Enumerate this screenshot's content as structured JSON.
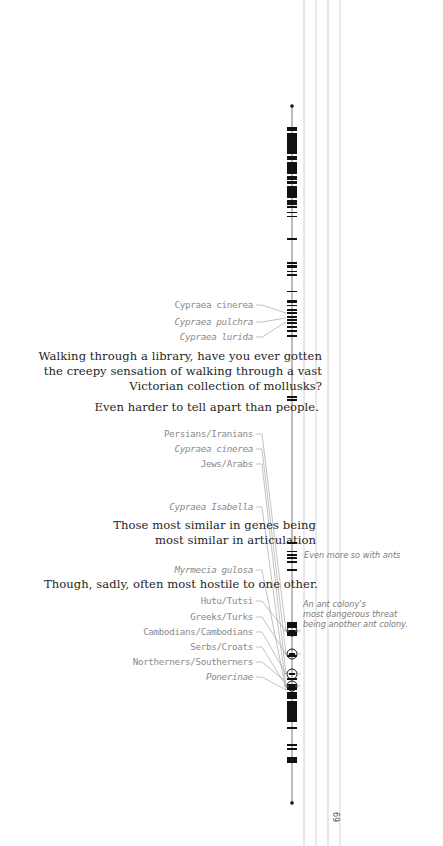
{
  "colors": {
    "ink": "#111111",
    "leader": "#9a9a9a",
    "guide": "#c8c8c8",
    "label": "#8a8a8a",
    "quote": "#1e1e1e"
  },
  "page_number": "69",
  "guides_x": [
    304,
    316,
    328,
    340
  ],
  "axis": {
    "x": 292,
    "top": 106,
    "bottom": 803
  },
  "bars": [
    [
      127,
      131
    ],
    [
      133,
      154
    ],
    [
      156,
      160
    ],
    [
      162,
      174
    ],
    [
      176,
      180
    ],
    [
      181,
      184
    ],
    [
      186,
      198
    ],
    [
      200,
      205
    ],
    [
      206,
      208
    ],
    [
      212,
      213
    ],
    [
      216,
      217
    ],
    [
      238,
      240
    ],
    [
      262,
      264
    ],
    [
      265,
      268
    ],
    [
      271,
      272
    ],
    [
      274,
      276
    ],
    [
      291,
      292
    ],
    [
      300,
      303
    ],
    [
      305,
      306
    ],
    [
      309,
      311
    ],
    [
      312,
      314
    ],
    [
      316,
      318
    ],
    [
      319,
      321
    ],
    [
      322,
      324
    ],
    [
      326,
      328
    ],
    [
      330,
      332
    ],
    [
      335,
      337
    ],
    [
      396,
      398
    ],
    [
      399,
      401
    ],
    [
      542,
      544
    ],
    [
      551,
      552
    ],
    [
      554,
      556
    ],
    [
      557,
      559
    ],
    [
      561,
      563
    ],
    [
      569,
      571
    ],
    [
      622,
      628
    ],
    [
      630,
      636
    ],
    [
      655,
      657
    ],
    [
      678,
      680
    ],
    [
      684,
      690
    ],
    [
      692,
      699
    ],
    [
      701,
      722
    ],
    [
      727,
      729
    ],
    [
      744,
      746
    ],
    [
      748,
      750
    ],
    [
      757,
      763
    ]
  ],
  "circles": [
    631,
    654,
    674,
    686
  ],
  "labels": [
    {
      "id": "cypraea-cinerea-1",
      "text": "Cypraea cinerea",
      "x": 253,
      "y": 305,
      "italic": false,
      "target": 313
    },
    {
      "id": "cypraea-pulchra",
      "text": "Cypraea pulchra",
      "x": 253,
      "y": 322,
      "italic": true,
      "target": 318
    },
    {
      "id": "cypraea-lurida",
      "text": "Cypraea lurida",
      "x": 253,
      "y": 337,
      "italic": true,
      "target": 322
    },
    {
      "id": "persians-iranians",
      "text": "Persians/Iranians",
      "x": 253,
      "y": 434,
      "italic": false,
      "target": 631
    },
    {
      "id": "cypraea-cinerea-2",
      "text": "Cypraea cinerea",
      "x": 253,
      "y": 449,
      "italic": true,
      "target": 654
    },
    {
      "id": "jews-arabs",
      "text": "Jews/Arabs",
      "x": 253,
      "y": 464,
      "italic": false,
      "target": 674
    },
    {
      "id": "cypraea-isabella",
      "text": "Cypraea Isabella",
      "x": 253,
      "y": 507,
      "italic": true,
      "target": 686
    },
    {
      "id": "myrmecia-gulosa",
      "text": "Myrmecia gulosa",
      "x": 253,
      "y": 570,
      "italic": true,
      "target": 690
    },
    {
      "id": "hutu-tutsi",
      "text": "Hutu/Tutsi",
      "x": 253,
      "y": 601,
      "italic": false,
      "target": 631
    },
    {
      "id": "greeks-turks",
      "text": "Greeks/Turks",
      "x": 253,
      "y": 617,
      "italic": false,
      "target": 654
    },
    {
      "id": "cambodians",
      "text": "Cambodians/Cambodians",
      "x": 253,
      "y": 632,
      "italic": false,
      "target": 674
    },
    {
      "id": "serbs-croats",
      "text": "Serbs/Croats",
      "x": 253,
      "y": 647,
      "italic": false,
      "target": 686
    },
    {
      "id": "northerners-southerners",
      "text": "Northerners/Southerners",
      "x": 253,
      "y": 662,
      "italic": false,
      "target": 682
    },
    {
      "id": "ponerinae",
      "text": "Ponerinae",
      "x": 253,
      "y": 677,
      "italic": true,
      "target": 690
    }
  ],
  "quotes": [
    {
      "id": "quote-library",
      "lines": [
        "Walking through a library, have you ever gotten",
        "the creepy sensation of walking through a vast",
        "Victorian collection of mollusks?"
      ],
      "right": 322,
      "top": 349
    },
    {
      "id": "quote-tell-apart",
      "lines": [
        "Even harder to tell apart than people."
      ],
      "right": 319,
      "top": 400
    },
    {
      "id": "quote-genes",
      "lines": [
        "Those most similar in genes being",
        "most similar in articulation"
      ],
      "right": 316,
      "top": 518
    },
    {
      "id": "quote-hostile",
      "lines": [
        "Though, sadly, often most hostile to one other."
      ],
      "right": 318,
      "top": 577
    }
  ],
  "notes": [
    {
      "id": "note-ants",
      "lines": [
        "Even more so with ants"
      ],
      "left": 304,
      "top": 550
    },
    {
      "id": "note-ant-colony",
      "lines": [
        "An ant colony's",
        "most dangerous threat",
        "being another ant colony."
      ],
      "left": 303,
      "top": 599
    }
  ]
}
